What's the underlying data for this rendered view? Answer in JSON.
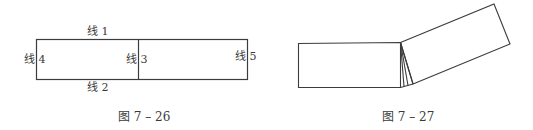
{
  "figure_left": {
    "caption": "图 7 – 26",
    "labels": {
      "line1": "线 1",
      "line2": "线 2",
      "line3": "线 3",
      "line4": "线 4",
      "line5": "线 5"
    }
  },
  "figure_right": {
    "caption": "图 7 – 27"
  },
  "colors": {
    "stroke": "#3c3c3c",
    "text": "#3a3a3a"
  }
}
